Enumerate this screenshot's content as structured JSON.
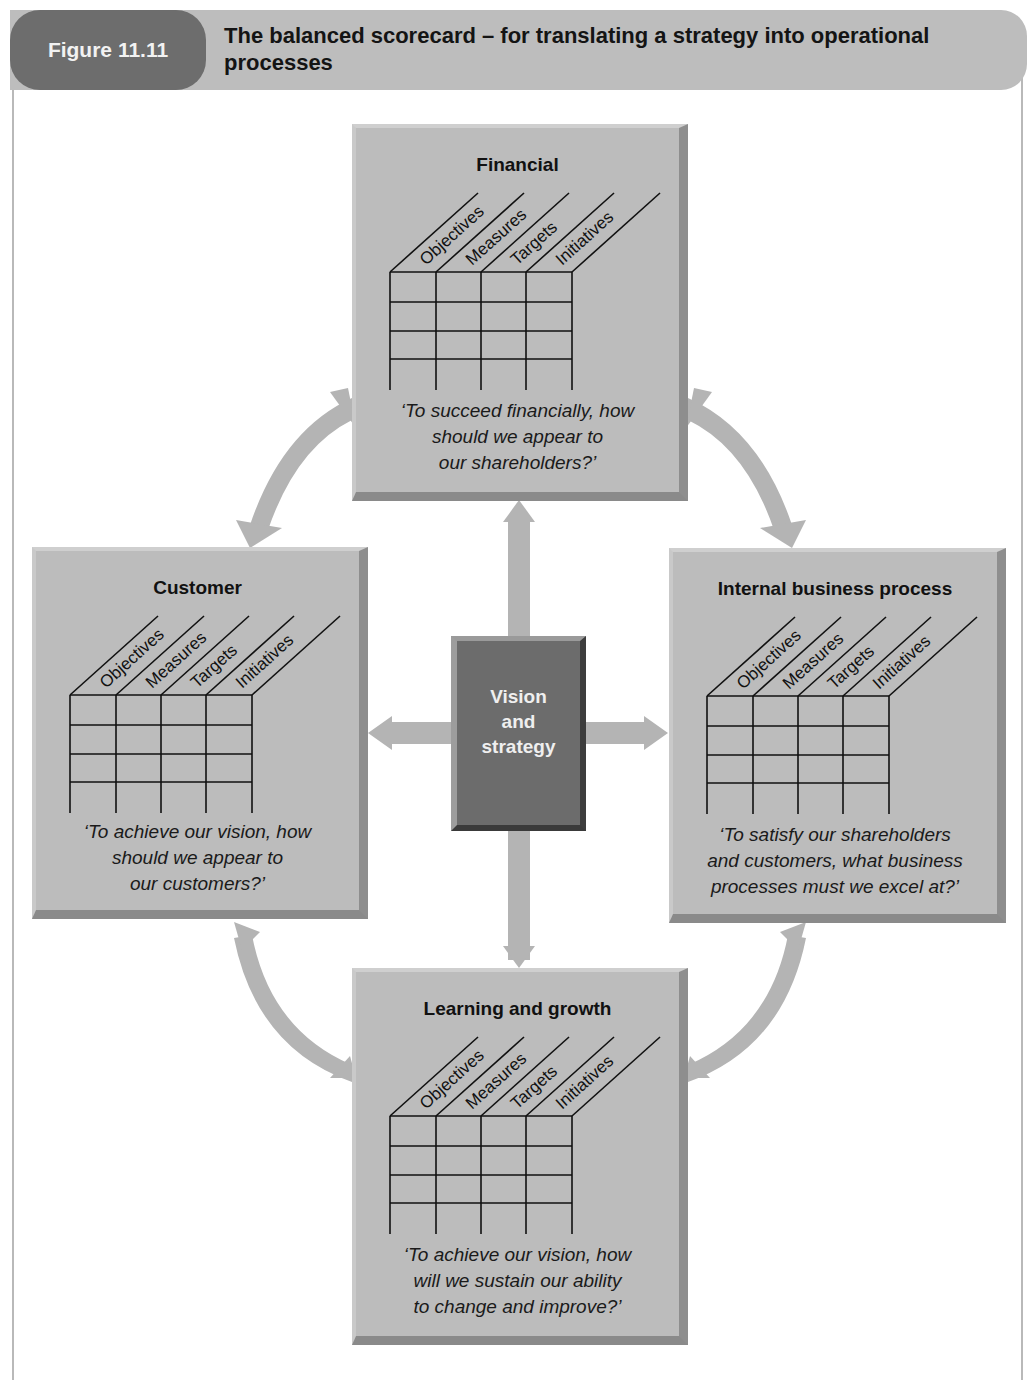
{
  "figure": {
    "label": "Figure 11.11",
    "title": "The balanced scorecard – for translating a strategy into operational processes"
  },
  "center": {
    "label_lines": [
      "Vision",
      "and",
      "strategy"
    ]
  },
  "column_headers": [
    "Objectives",
    "Measures",
    "Targets",
    "Initiatives"
  ],
  "perspectives": {
    "financial": {
      "title": "Financial",
      "question_lines": [
        "‘To succeed financially, how",
        "should we appear to",
        "our shareholders?’"
      ]
    },
    "customer": {
      "title": "Customer",
      "question_lines": [
        "‘To achieve our vision, how",
        "should we appear to",
        "our customers?’"
      ]
    },
    "internal": {
      "title": "Internal business process",
      "question_lines": [
        "‘To satisfy our shareholders",
        "and customers, what business",
        "processes must we excel at?’"
      ]
    },
    "learning": {
      "title": "Learning and growth",
      "question_lines": [
        "‘To achieve our vision, how",
        "will we sustain our ability",
        "to change and improve?’"
      ]
    }
  },
  "colors": {
    "card_fill": "#bcbcbc",
    "center_fill": "#6c6c6c",
    "arrow_fill": "#b4b4b4",
    "header_pill": "#6d6d6d",
    "header_bar": "#bdbdbd"
  }
}
